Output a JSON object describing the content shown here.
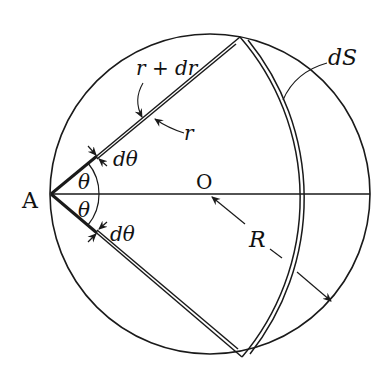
{
  "diagram": {
    "labels": {
      "point_a": "A",
      "center_o": "O",
      "radius_big": "R",
      "theta_upper": "θ",
      "theta_lower": "θ",
      "dtheta_upper": "dθ",
      "dtheta_lower": "dθ",
      "r_plus_dr": "r + dr",
      "r": "r",
      "surface_element": "dS"
    },
    "geometry": {
      "circle_center": [
        210,
        194
      ],
      "circle_radius": 160,
      "point_a": [
        51,
        194
      ],
      "inner_arc_radius": 246,
      "outer_arc_radius": 251,
      "stroke_color": "#1a1a1a"
    }
  }
}
